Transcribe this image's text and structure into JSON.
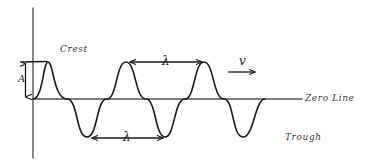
{
  "diagram": {
    "type": "hand-drawn-physics-wave",
    "background_color": "#ffffff",
    "ink_color": "#1a1a1a",
    "axis_color": "#4a4a4a",
    "labels": {
      "crest": "Crest",
      "trough": "Trough",
      "zero_line": "Zero Line",
      "amplitude": "A",
      "wavelength_top": "λ",
      "wavelength_bottom": "λ",
      "velocity": "v"
    },
    "wave": {
      "cycles": 3,
      "amplitude_px": 37,
      "wavelength_px": 77,
      "zero_line_y": 99,
      "start_x": 33,
      "end_x": 265,
      "crest_x": [
        48,
        126,
        204
      ],
      "trough_x": [
        87,
        165,
        243
      ],
      "crest_y": 62,
      "trough_y": 137
    },
    "axes": {
      "vertical_axis_x": 33,
      "vertical_axis_top": 8,
      "vertical_axis_bottom": 158,
      "zero_line_start_x": 33,
      "zero_line_end_x": 302
    },
    "markers": {
      "amplitude_arrow": {
        "x": 25,
        "y_top": 62,
        "y_bottom": 99
      },
      "amplitude_tick": {
        "x_start": 22,
        "x_end": 46,
        "y": 62
      },
      "wavelength_top_arrow": {
        "x_start": 128,
        "x_end": 204,
        "y": 62
      },
      "wavelength_bottom_arrow": {
        "x_start": 90,
        "x_end": 165,
        "y": 138
      },
      "velocity_arrow": {
        "x_start": 228,
        "x_end": 257,
        "y": 72
      }
    }
  }
}
